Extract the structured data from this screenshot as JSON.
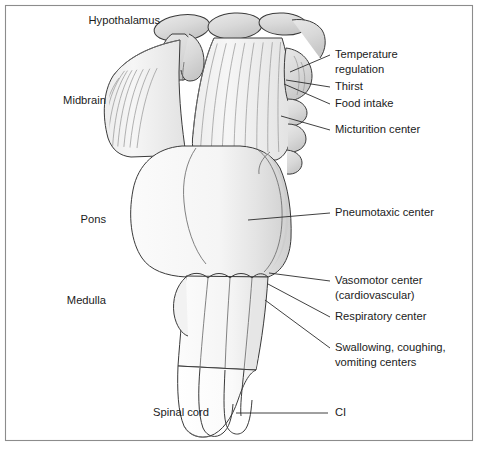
{
  "figure": {
    "frame": {
      "color": "#8c8c8c"
    },
    "background": "#ffffff"
  },
  "colors": {
    "outline": "#3a3a3a",
    "soft_outline": "#6d6d6d",
    "striation": "#9a9a9a",
    "leader": "#2b2b2b",
    "text": "#1b1b1b",
    "fill_light": "#f7f7f7",
    "fill_mid": "#e9e9e9",
    "fill_shade": "#d8d8d8",
    "fill_dark": "#c9c9c9"
  },
  "labels_left": [
    {
      "id": "hypothalamus",
      "text": "Hypothalamus",
      "x": 160,
      "y": 21
    },
    {
      "id": "midbrain",
      "text": "Midbrain",
      "x": 106,
      "y": 101
    },
    {
      "id": "pons",
      "text": "Pons",
      "x": 106,
      "y": 220
    },
    {
      "id": "medulla",
      "text": "Medulla",
      "x": 106,
      "y": 301
    },
    {
      "id": "spinal-cord",
      "text": "Spinal cord",
      "x": 209,
      "y": 413
    }
  ],
  "labels_right": [
    {
      "id": "temperature-regulation",
      "lines": [
        "Temperature",
        "regulation"
      ],
      "x": 335,
      "y": 55,
      "leader": {
        "x1": 290,
        "y1": 72,
        "x2": 330,
        "y2": 55
      }
    },
    {
      "id": "thirst",
      "lines": [
        "Thirst"
      ],
      "x": 335,
      "y": 87,
      "leader": {
        "x1": 286,
        "y1": 80,
        "x2": 330,
        "y2": 87
      }
    },
    {
      "id": "food-intake",
      "lines": [
        "Food intake"
      ],
      "x": 335,
      "y": 104,
      "leader": {
        "x1": 284,
        "y1": 84,
        "x2": 330,
        "y2": 104
      }
    },
    {
      "id": "micturition-center",
      "lines": [
        "Micturition center"
      ],
      "x": 335,
      "y": 130,
      "leader": {
        "x1": 281,
        "y1": 116,
        "x2": 330,
        "y2": 130
      }
    },
    {
      "id": "pneumotaxic-center",
      "lines": [
        "Pneumotaxic center"
      ],
      "x": 335,
      "y": 213,
      "leader": {
        "x1": 248,
        "y1": 220,
        "x2": 330,
        "y2": 213
      }
    },
    {
      "id": "vasomotor-center",
      "lines": [
        "Vasomotor center",
        "(cardiovascular)"
      ],
      "x": 335,
      "y": 281,
      "leader": {
        "x1": 269,
        "y1": 273,
        "x2": 330,
        "y2": 281
      }
    },
    {
      "id": "respiratory-center",
      "lines": [
        "Respiratory center"
      ],
      "x": 335,
      "y": 317,
      "leader": {
        "x1": 268,
        "y1": 284,
        "x2": 330,
        "y2": 317
      }
    },
    {
      "id": "swallowing-coughing-vomiting-centers",
      "lines": [
        "Swallowing, coughing,",
        "vomiting centers"
      ],
      "x": 335,
      "y": 348,
      "leader": {
        "x1": 265,
        "y1": 300,
        "x2": 330,
        "y2": 348
      }
    },
    {
      "id": "c1",
      "lines": [
        "CI"
      ],
      "x": 335,
      "y": 413,
      "leader": {
        "x1": 236,
        "y1": 413,
        "x2": 328,
        "y2": 413
      }
    }
  ],
  "structures": [
    {
      "id": "hypothalamus-lobes",
      "name": "hypothalamus-lobes"
    },
    {
      "id": "mammillary-bodies",
      "name": "mammillary-bodies"
    },
    {
      "id": "cerebral-peduncle-left",
      "name": "cerebral-peduncle-left"
    },
    {
      "id": "cerebral-peduncle-right",
      "name": "cerebral-peduncle-right"
    },
    {
      "id": "pons-body",
      "name": "pons-body"
    },
    {
      "id": "medulla-body",
      "name": "medulla-body"
    },
    {
      "id": "spinal-cord-body",
      "name": "spinal-cord-body"
    },
    {
      "id": "scalloped-lobes-right",
      "name": "scalloped-lobes-right"
    }
  ]
}
